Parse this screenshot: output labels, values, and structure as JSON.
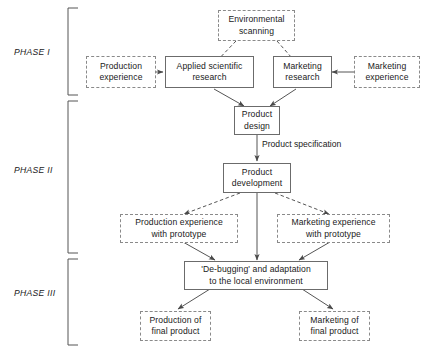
{
  "diagram": {
    "phases": [
      {
        "id": "phase-1",
        "label": "PHASE I"
      },
      {
        "id": "phase-2",
        "label": "PHASE II"
      },
      {
        "id": "phase-3",
        "label": "PHASE III"
      }
    ],
    "nodes": {
      "environmental_scanning": {
        "line1": "Environmental",
        "line2": "scanning",
        "style": "dashed"
      },
      "production_experience": {
        "line1": "Production",
        "line2": "experience",
        "style": "dashed"
      },
      "applied_scientific_research": {
        "line1": "Applied  scientific",
        "line2": "research",
        "style": "solid"
      },
      "marketing_research": {
        "line1": "Marketing",
        "line2": "research",
        "style": "solid"
      },
      "marketing_experience": {
        "line1": "Marketing",
        "line2": "experience",
        "style": "dashed"
      },
      "product_design": {
        "line1": "Product",
        "line2": "design",
        "style": "solid"
      },
      "product_development": {
        "line1": "Product",
        "line2": "development",
        "style": "solid"
      },
      "production_experience_prototype": {
        "line1": "Production experience",
        "line2": "with prototype",
        "style": "dashed"
      },
      "marketing_experience_prototype": {
        "line1": "Marketing experience",
        "line2": "with prototype",
        "style": "dashed"
      },
      "debugging_adaptation": {
        "line1": "'De-bugging' and adaptation",
        "line2": "to the local environment",
        "style": "solid"
      },
      "production_final_product": {
        "line1": "Production of",
        "line2": "final product",
        "style": "dashed"
      },
      "marketing_final_product": {
        "line1": "Marketing of",
        "line2": "final product",
        "style": "dashed"
      }
    },
    "edge_labels": {
      "product_specification": {
        "line1": "Product",
        "line2": "specification"
      }
    },
    "colors": {
      "solid_border": "#6b6b6b",
      "dashed_border": "#8a8a8a",
      "line": "#555555",
      "text": "#1a1a1a",
      "background": "#ffffff"
    }
  }
}
